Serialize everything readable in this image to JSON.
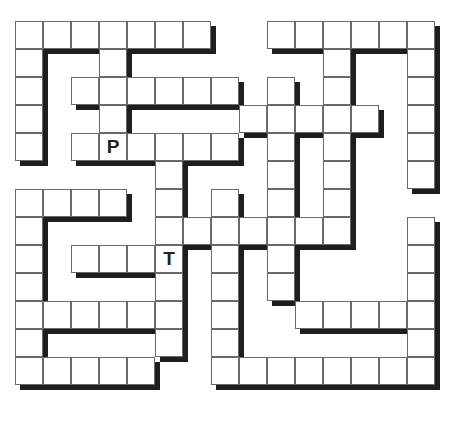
{
  "puzzle": {
    "type": "maze",
    "cell_size": 28,
    "columns": 15,
    "rows": 13,
    "colors": {
      "cell_fill": "#ffffff",
      "cell_border": "#6a6a6a",
      "shadow": "#1e1e1e",
      "label": "#222222"
    },
    "grid": [
      "#######..######",
      "#..#.......#..#",
      "#.######.#.#..#",
      "#..#....#####.#",
      "#.######.#.#..#",
      ".....#...#.#..#",
      "####.#.#.#.#...",
      "#....#######..#",
      "#.####.#.#....#",
      "#....#.#.#....#",
      "######.#..#####",
      "#....#.#......#",
      "#####..########"
    ],
    "markers": [
      {
        "label": "P",
        "row": 4,
        "col": 3
      },
      {
        "label": "T",
        "row": 8,
        "col": 5
      }
    ]
  }
}
